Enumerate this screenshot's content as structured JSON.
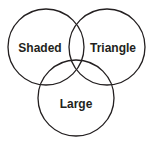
{
  "diagram": {
    "type": "venn",
    "stroke_color": "#231f20",
    "circles": [
      {
        "id": "shaded",
        "label": "Shaded",
        "cx": 46,
        "cy": 47,
        "r": 38
      },
      {
        "id": "triangle",
        "label": "Triangle",
        "cx": 107,
        "cy": 47,
        "r": 38
      },
      {
        "id": "large",
        "label": "Large",
        "cx": 76,
        "cy": 98,
        "r": 38
      }
    ]
  }
}
